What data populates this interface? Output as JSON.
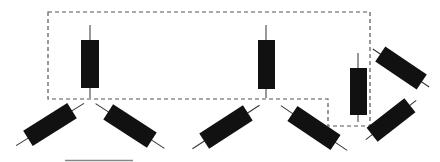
{
  "diagram": {
    "colors": {
      "background": "#ffffff",
      "component": "#111111",
      "lead": "#333333",
      "dashed_outline": "#555555",
      "scale_bar": "#888888"
    },
    "components": [
      {
        "id": "R1",
        "type": "resistor",
        "orientation": "vertical",
        "inside_outline": true
      },
      {
        "id": "R2",
        "type": "resistor",
        "orientation": "vertical",
        "inside_outline": true
      },
      {
        "id": "R3",
        "type": "resistor",
        "orientation": "vertical",
        "inside_outline": true
      },
      {
        "id": "R4",
        "type": "resistor",
        "orientation": "diagonal-up",
        "inside_outline": false
      },
      {
        "id": "R5",
        "type": "resistor",
        "orientation": "diagonal-down",
        "inside_outline": false
      },
      {
        "id": "R6",
        "type": "resistor",
        "orientation": "diagonal-up",
        "inside_outline": false
      },
      {
        "id": "R7",
        "type": "resistor",
        "orientation": "diagonal-down",
        "inside_outline": false
      },
      {
        "id": "R8",
        "type": "resistor",
        "orientation": "diagonal-down",
        "inside_outline": false
      },
      {
        "id": "R9",
        "type": "resistor",
        "orientation": "diagonal-up",
        "inside_outline": false
      }
    ],
    "scale_bar": {
      "label": ""
    }
  }
}
